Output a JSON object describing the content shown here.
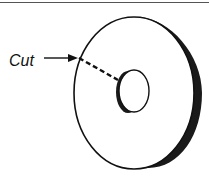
{
  "figure": {
    "label": "Cut",
    "colors": {
      "line": "#111111",
      "rim": "#1a1a1a",
      "background": "#ffffff"
    }
  }
}
